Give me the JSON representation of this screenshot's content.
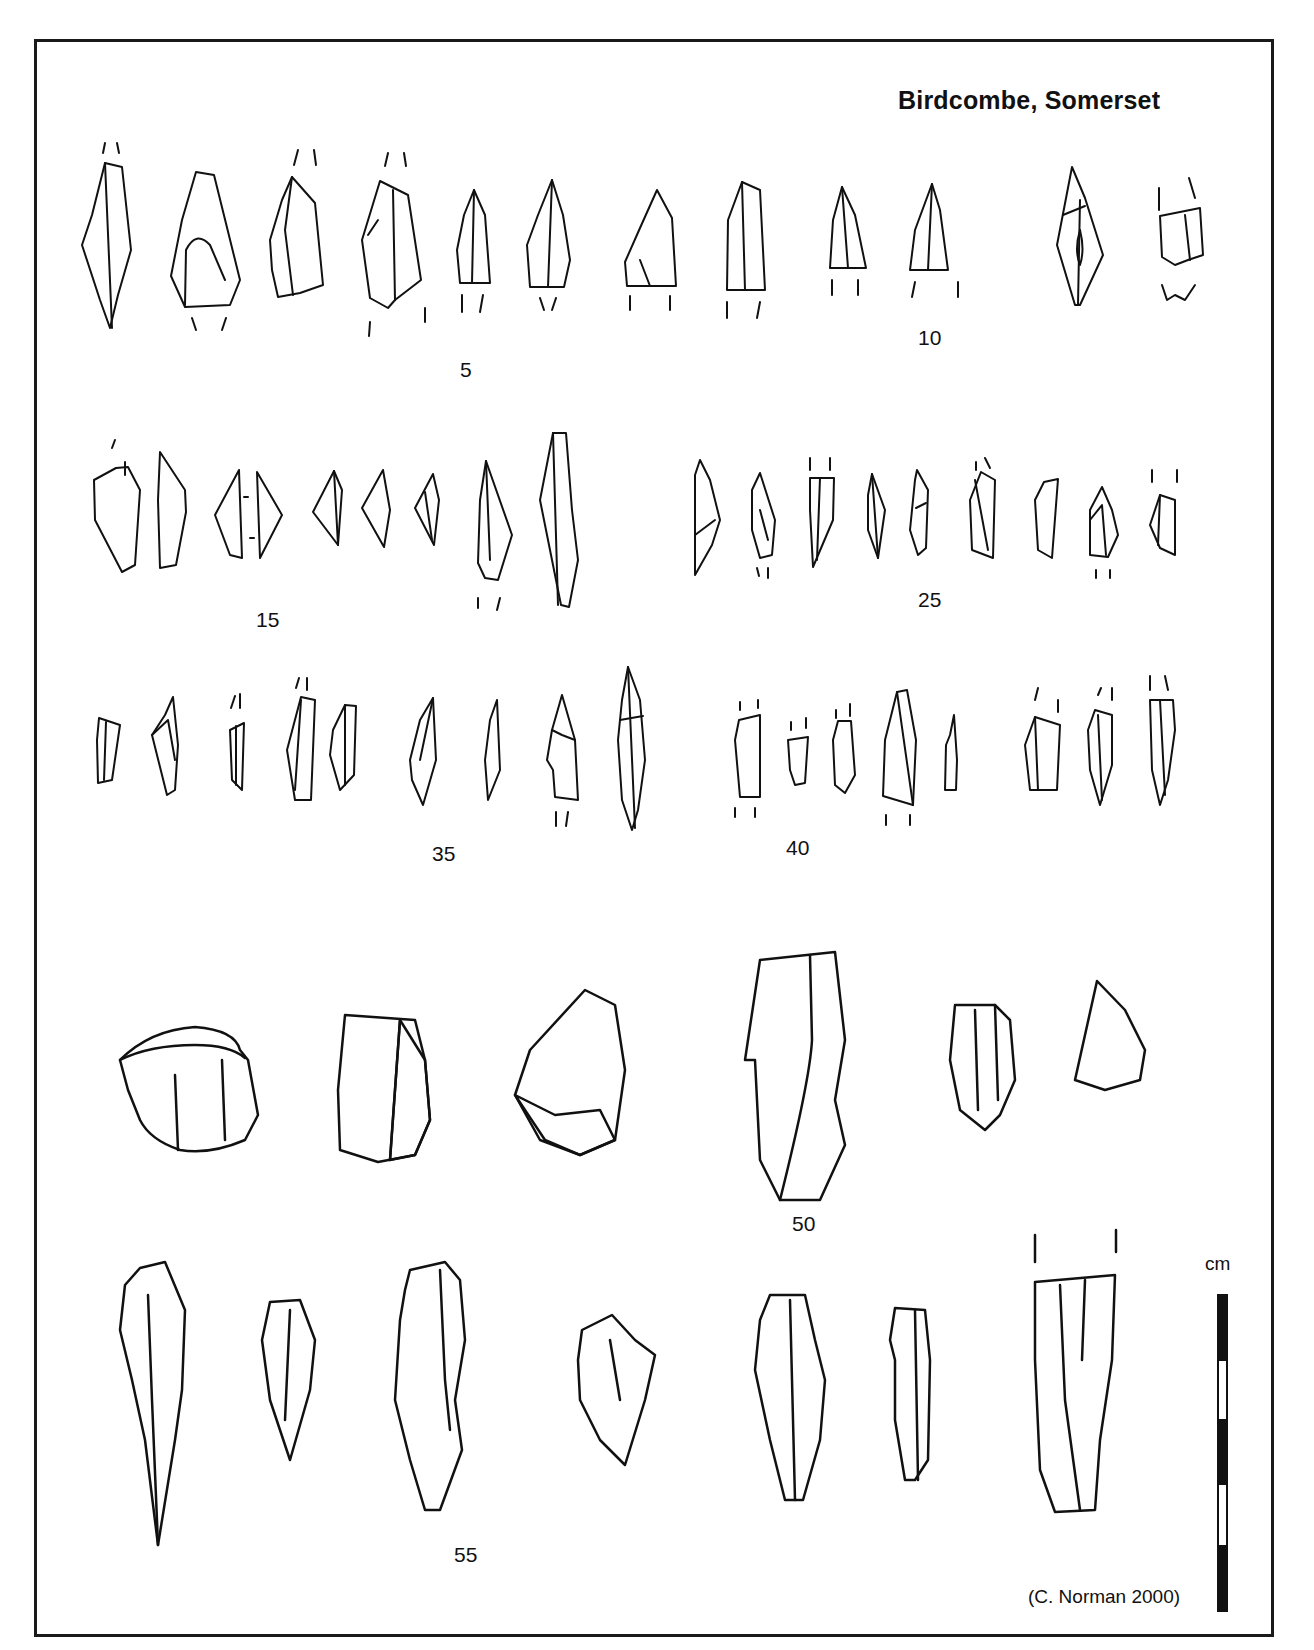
{
  "figure": {
    "title": "Birdcombe, Somerset",
    "credit": "(C. Norman 2000)",
    "scale_bar": {
      "unit_label": "cm",
      "segments": [
        "black",
        "white",
        "black",
        "white",
        "black"
      ]
    },
    "figure_numbers": [
      {
        "label": "5",
        "x": 460,
        "y": 358
      },
      {
        "label": "10",
        "x": 918,
        "y": 326
      },
      {
        "label": "15",
        "x": 256,
        "y": 608
      },
      {
        "label": "25",
        "x": 918,
        "y": 588
      },
      {
        "label": "35",
        "x": 432,
        "y": 842
      },
      {
        "label": "40",
        "x": 786,
        "y": 836
      },
      {
        "label": "50",
        "x": 792,
        "y": 1212
      },
      {
        "label": "55",
        "x": 454,
        "y": 1543
      }
    ],
    "rows": [
      {
        "name": "row-1-microliths",
        "count": 12
      },
      {
        "name": "row-2-microliths",
        "count": 16
      },
      {
        "name": "row-3-microliths",
        "count": 17
      },
      {
        "name": "row-4-cores-scrapers",
        "count": 6
      },
      {
        "name": "row-5-blades-points",
        "count": 7
      }
    ]
  }
}
